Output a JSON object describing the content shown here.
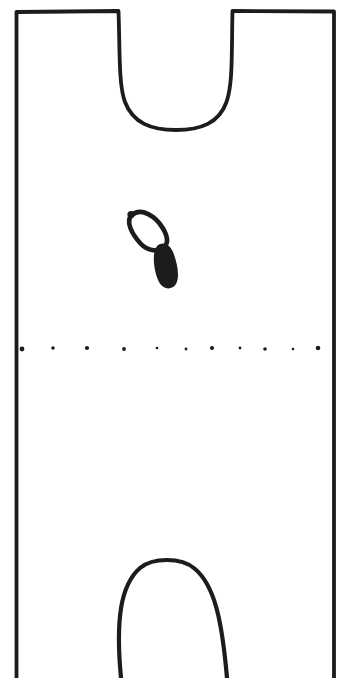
{
  "figure": {
    "type": "line-drawing",
    "colors": {
      "ink": "#1c1c1c",
      "paper": "#ffffff"
    },
    "canvas": {
      "width": 350,
      "height": 678
    },
    "outline": {
      "path": "M 16.5 678 L 16.5 12 L 118.5 11 C 120 52 118.5 84 125 102 C 133 123 151 130 176 130 C 201 130 219 123 226.5 102 C 233 84 231.5 52 232.5 11 L 334 11.5 L 334 678",
      "stroke_width": 3.8
    },
    "sprout": {
      "loop_path": "M 131.5 215.5 C 141 206.5 156 216.5 163 228.5 C 168 237 168.5 244 163 248 C 157 252.5 147 250.5 140.5 243.5 C 131.5 233.5 125.5 221.5 131.5 215.5 Z",
      "loop_stroke_width": 4.6,
      "tail_path": "M 157.5 245.5 C 162.5 241 170 244 173 252 C 177.5 263 180 277 176 284 C 172 290.5 162.5 290 158.5 281 C 153.5 270 151.5 251.5 157.5 245.5 Z",
      "knob": {
        "cx": 131,
        "cy": 214.5,
        "r": 3.6
      }
    },
    "midline": {
      "y": 349,
      "dots": [
        {
          "x": 22,
          "y": 349,
          "r": 2.4
        },
        {
          "x": 53,
          "y": 348,
          "r": 1.8
        },
        {
          "x": 87,
          "y": 348,
          "r": 2.1
        },
        {
          "x": 124,
          "y": 349,
          "r": 1.9
        },
        {
          "x": 157,
          "y": 348,
          "r": 1.3
        },
        {
          "x": 186,
          "y": 349,
          "r": 1.4
        },
        {
          "x": 212,
          "y": 348,
          "r": 2.1
        },
        {
          "x": 240,
          "y": 348,
          "r": 1.4
        },
        {
          "x": 265,
          "y": 349,
          "r": 1.8
        },
        {
          "x": 293,
          "y": 349,
          "r": 1.3
        },
        {
          "x": 318,
          "y": 348,
          "r": 2.3
        }
      ]
    },
    "bottom_arch": {
      "path": "M 121 678 C 115.5 620 120.5 585 140 568 C 152.5 557.5 181 557 194.5 568.5 C 214.5 585 222 620 227 678",
      "stroke_width": 4.2
    }
  }
}
